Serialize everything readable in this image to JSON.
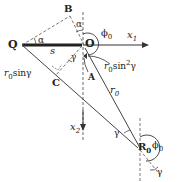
{
  "diagram": {
    "points": {
      "Q": "Q",
      "O": "O",
      "B": "B",
      "C": "C",
      "A": "A",
      "R0": "R",
      "R0_sub": "0"
    },
    "axes": {
      "x1": "x",
      "x1_sub": "1",
      "x2": "x",
      "x2_sub": "2"
    },
    "angles": {
      "alpha_top": "α",
      "alpha_left": "α",
      "phi0_top": "ϕ",
      "phi0_top_sub": "0",
      "phi0_bottom": "ϕ",
      "phi0_bottom_sub": "0",
      "gamma_mid": "γ",
      "gamma_lower": "γ",
      "gamma_bottom": "γ"
    },
    "lengths": {
      "s": "s",
      "r0": "r",
      "r0_sub": "0",
      "r0_sin_gamma": "sinγ",
      "r0_sin_gamma_prefix": "r",
      "r0_sin_gamma_sub": "0",
      "r0_sin2_gamma_prefix": "r",
      "r0_sin2_gamma_sub": "0",
      "r0_sin2_gamma_mid": "sin",
      "r0_sin2_gamma_sup": "2",
      "r0_sin2_gamma_end": "γ"
    }
  }
}
